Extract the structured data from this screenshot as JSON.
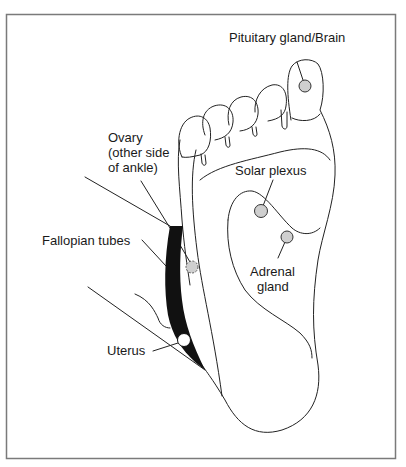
{
  "diagram": {
    "frame_color": "#7a7a7a",
    "ink_color": "#222222",
    "point_fill": "#cfcfcf",
    "labels": {
      "pituitary": "Pituitary gland/Brain",
      "ovary_line1": "Ovary",
      "ovary_line2": "(other side",
      "ovary_line3": "of ankle)",
      "fallopian": "Fallopian tubes",
      "uterus": "Uterus",
      "solar_plexus": "Solar plexus",
      "adrenal_line1": "Adrenal",
      "adrenal_line2": "gland"
    },
    "points": [
      {
        "name": "Pituitary gland/Brain",
        "x": 305,
        "y": 86,
        "style": "gray"
      },
      {
        "name": "Solar plexus",
        "x": 261,
        "y": 211,
        "style": "gray"
      },
      {
        "name": "Adrenal gland",
        "x": 287,
        "y": 237,
        "style": "gray"
      },
      {
        "name": "Ovary",
        "x": 192,
        "y": 267,
        "style": "dashed-gray"
      },
      {
        "name": "Uterus",
        "x": 184,
        "y": 340,
        "style": "white"
      }
    ]
  }
}
